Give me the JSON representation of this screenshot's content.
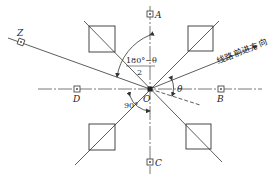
{
  "diagram": {
    "type": "survey-stake-layout",
    "center_label": "O",
    "points": {
      "A": "A",
      "B": "B",
      "C": "C",
      "D": "D",
      "Z": "Z"
    },
    "direction_label": "线路前进方向",
    "angles": {
      "theta": "θ",
      "right_angle": "90°",
      "half_angle_numerator": "180°−θ",
      "half_angle_denominator": "2"
    },
    "colors": {
      "line": "#333333",
      "background": "#ffffff"
    }
  }
}
